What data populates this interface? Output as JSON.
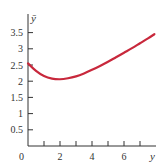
{
  "chart_data": {
    "type": "line",
    "title": "",
    "xlabel": "y",
    "ylabel": "ȳ",
    "xlim": [
      0,
      8
    ],
    "ylim": [
      0,
      3.9
    ],
    "x_ticks": [
      0,
      1,
      2,
      3,
      4,
      5,
      6,
      7
    ],
    "x_tick_labels": [
      "0",
      "",
      "2",
      "",
      "4",
      "",
      "6",
      ""
    ],
    "y_ticks": [
      0.5,
      1,
      1.5,
      2,
      2.5,
      3,
      3.5
    ],
    "y_tick_labels": [
      "0.5",
      "1",
      "1.5",
      "2",
      "2.5",
      "3",
      "3.5"
    ],
    "origin_label": "0",
    "grid": false,
    "legend": null,
    "series": [
      {
        "name": "curve",
        "color": "#c8283c",
        "x": [
          0,
          0.5,
          1,
          1.5,
          2,
          2.5,
          3,
          3.5,
          4,
          4.5,
          5,
          5.5,
          6,
          6.5,
          7,
          7.5,
          7.9
        ],
        "values": [
          2.55,
          2.32,
          2.16,
          2.08,
          2.06,
          2.09,
          2.15,
          2.24,
          2.35,
          2.47,
          2.6,
          2.74,
          2.88,
          3.02,
          3.17,
          3.32,
          3.45
        ]
      }
    ]
  },
  "colors": {
    "axis": "#333333",
    "curve": "#c8283c"
  }
}
